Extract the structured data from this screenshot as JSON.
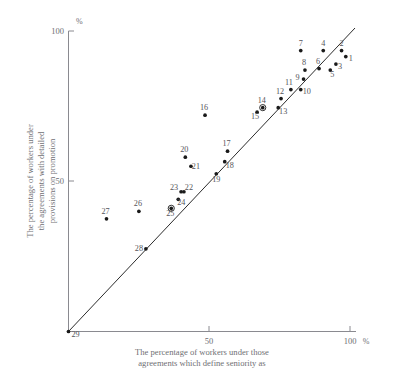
{
  "chart_data": {
    "type": "scatter",
    "title": "",
    "xlabel": "The percentage of workers under those agreements which define seniority as",
    "xlabel_line1": "The percentage of workers under those",
    "xlabel_line2": "agreements which define seniority as",
    "ylabel": "The percentage of workers under the agreements with detailed provisions on promotion",
    "ylabel_line1": "The percentage of workers under",
    "ylabel_line2": "the  agreements  with  detailed",
    "ylabel_line3": "provisions on promotion",
    "x_unit": "%",
    "y_unit": "%",
    "xlim": [
      0,
      100
    ],
    "ylim": [
      0,
      100
    ],
    "xticks": [
      50,
      100
    ],
    "yticks": [
      50,
      100
    ],
    "xtick_labels": [
      "50",
      "100"
    ],
    "ytick_labels": [
      "50",
      "100"
    ],
    "x_axis_unit_label": "%",
    "y_axis_unit_label": "%",
    "grid": false,
    "legend": false,
    "reference_line": {
      "type": "identity",
      "label": "y = x",
      "from": [
        0,
        0
      ],
      "to": [
        100,
        100
      ]
    },
    "point_label_position": "adjacent",
    "points": [
      {
        "id": "1",
        "x": 98.5,
        "y": 91.5,
        "label_dx": 5,
        "label_dy": 4,
        "marker": "dot"
      },
      {
        "id": "2",
        "x": 97.0,
        "y": 93.5,
        "label_dx": 0,
        "label_dy": -5,
        "marker": "dot"
      },
      {
        "id": "3",
        "x": 95.0,
        "y": 89.0,
        "label_dx": 4,
        "label_dy": 5,
        "marker": "dot"
      },
      {
        "id": "4",
        "x": 90.5,
        "y": 93.5,
        "label_dx": 0,
        "label_dy": -5,
        "marker": "dot"
      },
      {
        "id": "5",
        "x": 93.0,
        "y": 87.0,
        "label_dx": 2,
        "label_dy": 7,
        "marker": "dot"
      },
      {
        "id": "6",
        "x": 89.0,
        "y": 87.5,
        "label_dx": -1,
        "label_dy": -5,
        "marker": "dot"
      },
      {
        "id": "7",
        "x": 82.5,
        "y": 93.5,
        "label_dx": 0,
        "label_dy": -5,
        "marker": "dot"
      },
      {
        "id": "8",
        "x": 84.0,
        "y": 87.0,
        "label_dx": -1,
        "label_dy": -5,
        "marker": "dot"
      },
      {
        "id": "9",
        "x": 83.5,
        "y": 84.0,
        "label_dx": -6,
        "label_dy": 1,
        "marker": "dot"
      },
      {
        "id": "10",
        "x": 82.5,
        "y": 80.5,
        "label_dx": 6,
        "label_dy": 4,
        "marker": "dot"
      },
      {
        "id": "11",
        "x": 79.0,
        "y": 80.5,
        "label_dx": -2,
        "label_dy": -5,
        "marker": "dot"
      },
      {
        "id": "12",
        "x": 75.5,
        "y": 77.5,
        "label_dx": -1,
        "label_dy": -5,
        "marker": "dot"
      },
      {
        "id": "13",
        "x": 74.5,
        "y": 74.5,
        "label_dx": 5,
        "label_dy": 6,
        "marker": "dot"
      },
      {
        "id": "14",
        "x": 69.0,
        "y": 74.5,
        "label_dx": -1,
        "label_dy": -5,
        "marker": "ringed"
      },
      {
        "id": "15",
        "x": 67.0,
        "y": 73.0,
        "label_dx": -2,
        "label_dy": 7,
        "marker": "dot"
      },
      {
        "id": "16",
        "x": 48.5,
        "y": 72.0,
        "label_dx": -1,
        "label_dy": -5,
        "marker": "dot"
      },
      {
        "id": "17",
        "x": 56.5,
        "y": 60.0,
        "label_dx": -1,
        "label_dy": -5,
        "marker": "dot"
      },
      {
        "id": "18",
        "x": 55.5,
        "y": 56.5,
        "label_dx": 5,
        "label_dy": 6,
        "marker": "dot"
      },
      {
        "id": "19",
        "x": 52.5,
        "y": 52.5,
        "label_dx": 0,
        "label_dy": 8,
        "marker": "dot"
      },
      {
        "id": "20",
        "x": 41.5,
        "y": 58.0,
        "label_dx": -1,
        "label_dy": -5,
        "marker": "dot"
      },
      {
        "id": "21",
        "x": 43.5,
        "y": 55.0,
        "label_dx": 5,
        "label_dy": 3,
        "marker": "dot"
      },
      {
        "id": "22",
        "x": 41.0,
        "y": 46.5,
        "label_dx": 5,
        "label_dy": -2,
        "marker": "dot"
      },
      {
        "id": "23",
        "x": 40.0,
        "y": 46.5,
        "label_dx": -7,
        "label_dy": -2,
        "marker": "dot"
      },
      {
        "id": "24",
        "x": 39.0,
        "y": 44.0,
        "label_dx": 3,
        "label_dy": 6,
        "marker": "dot"
      },
      {
        "id": "25",
        "x": 36.5,
        "y": 41.0,
        "label_dx": -1,
        "label_dy": 8,
        "marker": "ringed"
      },
      {
        "id": "26",
        "x": 25.0,
        "y": 40.0,
        "label_dx": -1,
        "label_dy": -5,
        "marker": "dot"
      },
      {
        "id": "27",
        "x": 13.5,
        "y": 37.5,
        "label_dx": -1,
        "label_dy": -5,
        "marker": "dot"
      },
      {
        "id": "28",
        "x": 27.5,
        "y": 27.5,
        "label_dx": -7,
        "label_dy": 2,
        "marker": "dot"
      },
      {
        "id": "29",
        "x": 0.0,
        "y": 0.0,
        "label_dx": 7,
        "label_dy": 5,
        "marker": "dot"
      }
    ]
  }
}
